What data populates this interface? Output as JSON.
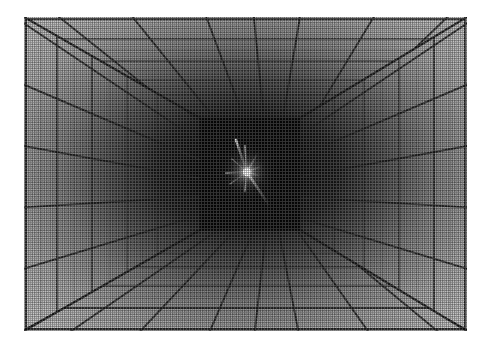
{
  "image": {
    "title": "Perspective grid room with central point light",
    "render_style": "grayscale dithered halftone raster",
    "canvas": {
      "width": 487,
      "height": 354,
      "background": "#ffffff"
    },
    "frame": {
      "left": 24,
      "top": 17,
      "width": 443,
      "height": 314
    }
  },
  "scene": {
    "type": "one-point-perspective-box",
    "description": "Interior of a rectangular room whose ceiling, floor, left wall and right wall are covered in a regular square grid that converges to a single vanishing point at the centre of the far wall.",
    "vanishing_point": {
      "x": 247,
      "y": 172
    },
    "back_wall": {
      "x": 200,
      "y": 118,
      "width": 100,
      "height": 112
    },
    "surfaces": [
      {
        "name": "ceiling",
        "shading": "light near viewer, fades to black at back wall"
      },
      {
        "name": "floor",
        "shading": "light near viewer, fades to black at back wall"
      },
      {
        "name": "left-wall",
        "shading": "light near viewer, fades to black at back wall"
      },
      {
        "name": "right-wall",
        "shading": "light near viewer, fades to black at back wall"
      },
      {
        "name": "back-wall",
        "shading": "near black, brightest at the point light"
      }
    ]
  },
  "light": {
    "name": "point-light-star",
    "center": {
      "x": 247,
      "y": 172
    },
    "core_radius": 4,
    "core_color": "#ffffff",
    "glow_color": "#9a9a9a",
    "ray_count": 8,
    "rays": [
      {
        "angle_deg": -108,
        "length": 34
      },
      {
        "angle_deg": -84,
        "length": 26
      },
      {
        "angle_deg": -60,
        "length": 22
      },
      {
        "angle_deg": -22,
        "length": 16
      },
      {
        "angle_deg": 16,
        "length": 13
      },
      {
        "angle_deg": 56,
        "length": 40
      },
      {
        "angle_deg": 96,
        "length": 19
      },
      {
        "angle_deg": 176,
        "length": 21
      }
    ]
  },
  "palette": {
    "paper_white": "#ffffff",
    "near_surface_gray": "#c9c9c9",
    "mid_surface_gray": "#8a8a8a",
    "far_black": "#0a0a0a",
    "grid_line_dark": "#2b2b2b",
    "grid_line_fine": "#6f6f6f",
    "highlight_white": "#ffffff"
  },
  "grid": {
    "major_divisions_per_wall": 6,
    "depth_bands": 7,
    "fine_subdivision": true,
    "line_style": "solid, thinning and darkening with depth"
  }
}
